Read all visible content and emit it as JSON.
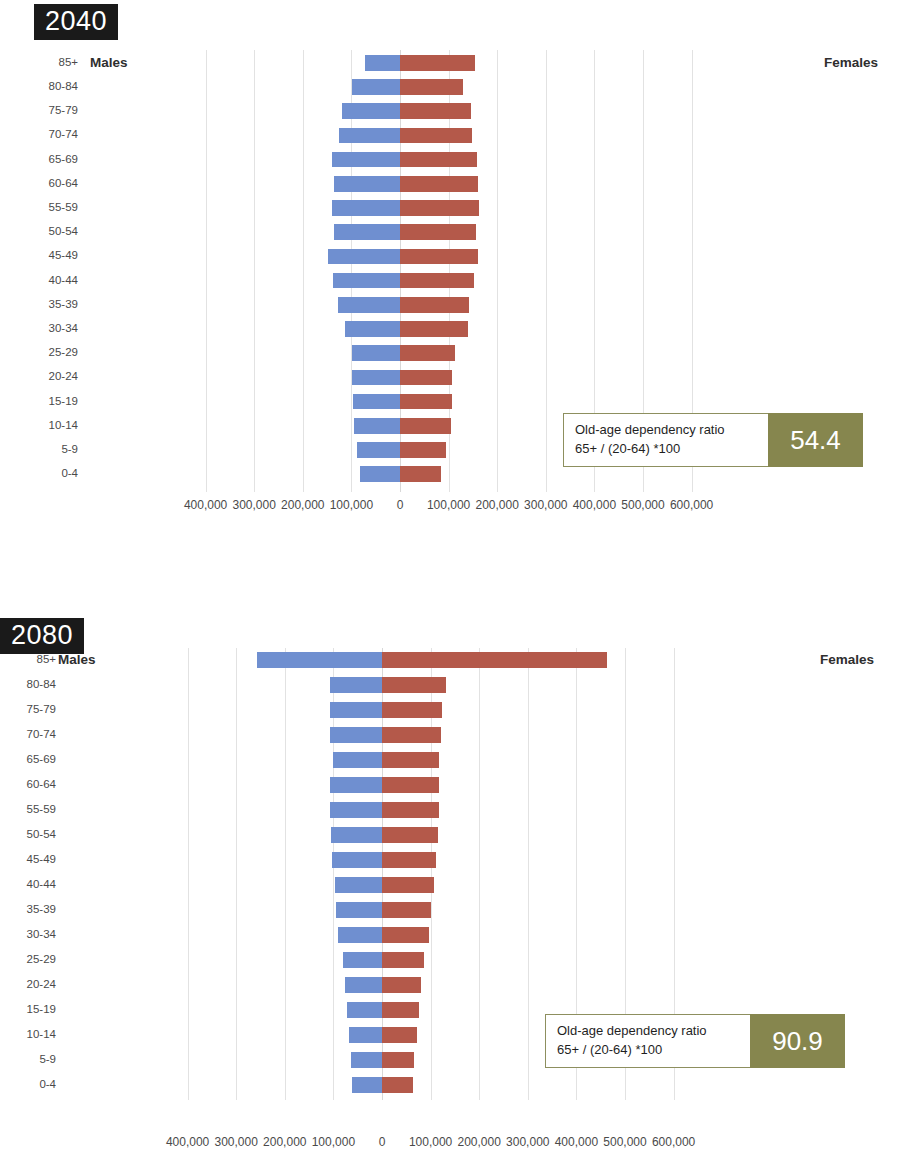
{
  "charts": [
    {
      "year_label": "2040",
      "males_label": "Males",
      "females_label": "Females",
      "ratio": {
        "line1": "Old-age dependency ratio",
        "line2": "65+ / (20-64) *100",
        "value": "54.4"
      },
      "axis_ticks": [
        "400,000",
        "300,000",
        "200,000",
        "100,000",
        "0",
        "100,000",
        "200,000",
        "300,000",
        "400,000",
        "500,000",
        "600,000"
      ],
      "categories": [
        "85+",
        "80-84",
        "75-79",
        "70-74",
        "65-69",
        "60-64",
        "55-59",
        "50-54",
        "45-49",
        "40-44",
        "35-39",
        "30-34",
        "25-29",
        "20-24",
        "15-19",
        "10-14",
        "5-9",
        "0-4"
      ]
    },
    {
      "year_label": "2080",
      "males_label": "Males",
      "females_label": "Females",
      "ratio": {
        "line1": "Old-age dependency ratio",
        "line2": "65+ / (20-64) *100",
        "value": "90.9"
      },
      "axis_ticks": [
        "400,000",
        "300,000",
        "200,000",
        "100,000",
        "0",
        "100,000",
        "200,000",
        "300,000",
        "400,000",
        "500,000",
        "600,000"
      ],
      "categories": [
        "85+",
        "80-84",
        "75-79",
        "70-74",
        "65-69",
        "60-64",
        "55-59",
        "50-54",
        "45-49",
        "40-44",
        "35-39",
        "30-34",
        "25-29",
        "20-24",
        "15-19",
        "10-14",
        "5-9",
        "0-4"
      ]
    }
  ],
  "colors": {
    "male_bar": "#6f8fd0",
    "female_bar": "#b4594a",
    "ratio_accent": "#86864e",
    "year_badge_bg": "#1a1a1a"
  },
  "chart_data": [
    {
      "type": "bar",
      "title": "2040",
      "subtitle": "Population pyramid by age group and sex",
      "orientation": "horizontal-diverging",
      "xlabel": "",
      "ylabel": "Age group",
      "xlim": [
        -400000,
        600000
      ],
      "xtick_values": [
        -400000,
        -300000,
        -200000,
        -100000,
        0,
        100000,
        200000,
        300000,
        400000,
        500000,
        600000
      ],
      "xtick_labels": [
        "400,000",
        "300,000",
        "200,000",
        "100,000",
        "0",
        "100,000",
        "200,000",
        "300,000",
        "400,000",
        "500,000",
        "600,000"
      ],
      "grid": true,
      "legend": [
        "Males",
        "Females"
      ],
      "legend_position": "inline-sides",
      "categories": [
        "85+",
        "80-84",
        "75-79",
        "70-74",
        "65-69",
        "60-64",
        "55-59",
        "50-54",
        "45-49",
        "40-44",
        "35-39",
        "30-34",
        "25-29",
        "20-24",
        "15-19",
        "10-14",
        "5-9",
        "0-4"
      ],
      "series": [
        {
          "name": "Males",
          "side": "left",
          "values": [
            72000,
            98000,
            119000,
            126000,
            140000,
            136000,
            139000,
            136000,
            148000,
            137000,
            127000,
            114000,
            99000,
            98000,
            97000,
            95000,
            88000,
            83000
          ]
        },
        {
          "name": "Females",
          "side": "right",
          "values": [
            155000,
            130000,
            146000,
            148000,
            158000,
            160000,
            162000,
            156000,
            160000,
            152000,
            141000,
            139000,
            113000,
            108000,
            106000,
            104000,
            94000,
            84000
          ]
        }
      ],
      "annotations": [
        {
          "text": "Old-age dependency ratio 65+ / (20-64) *100",
          "value": "54.4"
        }
      ]
    },
    {
      "type": "bar",
      "title": "2080",
      "subtitle": "Population pyramid by age group and sex",
      "orientation": "horizontal-diverging",
      "xlabel": "",
      "ylabel": "Age group",
      "xlim": [
        -400000,
        600000
      ],
      "xtick_values": [
        -400000,
        -300000,
        -200000,
        -100000,
        0,
        100000,
        200000,
        300000,
        400000,
        500000,
        600000
      ],
      "xtick_labels": [
        "400,000",
        "300,000",
        "200,000",
        "100,000",
        "0",
        "100,000",
        "200,000",
        "300,000",
        "400,000",
        "500,000",
        "600,000"
      ],
      "grid": true,
      "legend": [
        "Males",
        "Females"
      ],
      "legend_position": "inline-sides",
      "categories": [
        "85+",
        "80-84",
        "75-79",
        "70-74",
        "65-69",
        "60-64",
        "55-59",
        "50-54",
        "45-49",
        "40-44",
        "35-39",
        "30-34",
        "25-29",
        "20-24",
        "15-19",
        "10-14",
        "5-9",
        "0-4"
      ],
      "series": [
        {
          "name": "Males",
          "side": "left",
          "values": [
            258000,
            108000,
            107000,
            107000,
            101000,
            108000,
            107000,
            105000,
            103000,
            97000,
            94000,
            90000,
            81000,
            76000,
            72000,
            68000,
            63000,
            61000
          ]
        },
        {
          "name": "Females",
          "side": "right",
          "values": [
            463000,
            131000,
            124000,
            122000,
            117000,
            117000,
            117000,
            116000,
            112000,
            106000,
            101000,
            96000,
            87000,
            80000,
            76000,
            71000,
            66000,
            64000
          ]
        }
      ],
      "annotations": [
        {
          "text": "Old-age dependency ratio 65+ / (20-64) *100",
          "value": "90.9"
        }
      ]
    }
  ]
}
